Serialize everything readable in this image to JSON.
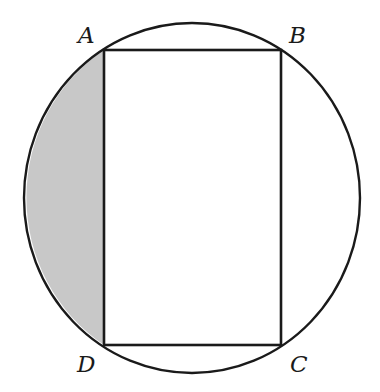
{
  "diagram": {
    "type": "geometry",
    "colors": {
      "background": "#ffffff",
      "stroke": "#1a1a1a",
      "shaded_region": "#c8c8c8"
    },
    "circle": {
      "cx": 192,
      "cy": 198,
      "rx": 168,
      "ry": 175
    },
    "rectangle": {
      "vertices": {
        "A": [
          104,
          50
        ],
        "B": [
          281,
          50
        ],
        "C": [
          281,
          345
        ],
        "D": [
          104,
          345
        ]
      }
    },
    "labels": {
      "A": "A",
      "B": "B",
      "C": "C",
      "D": "D"
    },
    "shaded_region": "segment bounded by chord AD and minor arc AD (left side)"
  }
}
